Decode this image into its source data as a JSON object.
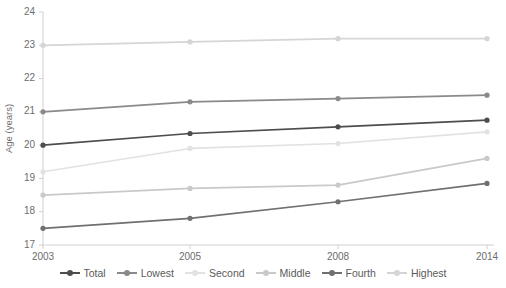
{
  "chart_data": {
    "type": "line",
    "title": "",
    "xlabel": "",
    "ylabel": "Age (years)",
    "categories": [
      "2003",
      "2005",
      "2008",
      "2014"
    ],
    "x": [
      2003,
      2005,
      2008,
      2014
    ],
    "ylim": [
      17,
      24
    ],
    "yticks": [
      17,
      18,
      19,
      20,
      21,
      22,
      23,
      24
    ],
    "ytick_labels": [
      "17",
      "18",
      "19",
      "20",
      "21",
      "22",
      "23",
      "24"
    ],
    "grid": false,
    "legend_position": "bottom",
    "markers": true,
    "series": [
      {
        "name": "Total",
        "color": "#4d4d4d",
        "values": [
          20.0,
          20.35,
          20.55,
          20.75
        ]
      },
      {
        "name": "Lowest",
        "color": "#8a8a8a",
        "values": [
          21.0,
          21.3,
          21.4,
          21.5
        ]
      },
      {
        "name": "Second",
        "color": "#e2e2e2",
        "values": [
          19.2,
          19.9,
          20.05,
          20.4
        ]
      },
      {
        "name": "Middle",
        "color": "#c9c9c9",
        "values": [
          18.5,
          18.7,
          18.8,
          19.6
        ]
      },
      {
        "name": "Fourth",
        "color": "#707070",
        "values": [
          17.5,
          17.8,
          18.3,
          18.85
        ]
      },
      {
        "name": "Highest",
        "color": "#d5d5d5",
        "values": [
          23.0,
          23.1,
          23.2,
          23.2
        ]
      }
    ]
  },
  "legend": {
    "items": [
      {
        "label": "Total"
      },
      {
        "label": "Lowest"
      },
      {
        "label": "Second"
      },
      {
        "label": "Middle"
      },
      {
        "label": "Fourth"
      },
      {
        "label": "Highest"
      }
    ]
  },
  "colors": {
    "axis": "#d0d0d0",
    "tick_text": "#6d6d6d",
    "background": "#ffffff"
  }
}
